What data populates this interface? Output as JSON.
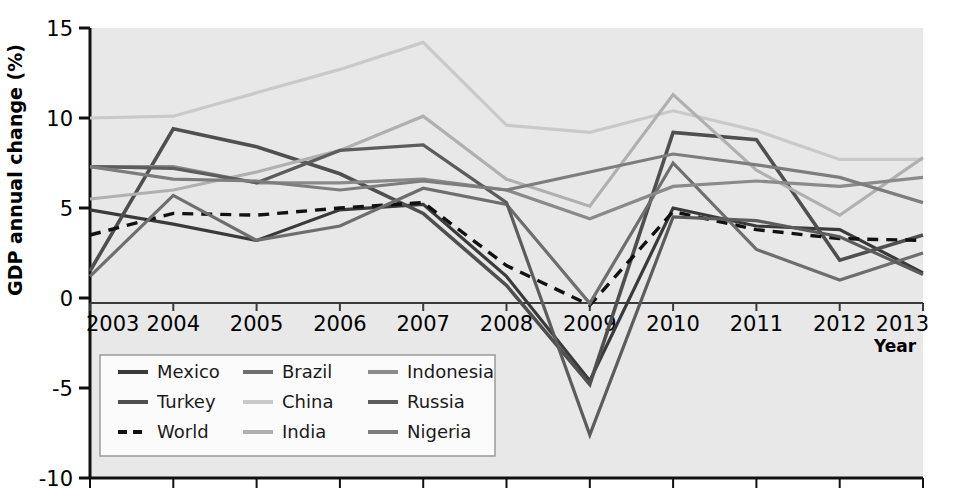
{
  "chart_data": {
    "type": "line",
    "title": "",
    "xlabel": "Year",
    "ylabel": "GDP annual change (%)",
    "x": [
      2003,
      2004,
      2005,
      2006,
      2007,
      2008,
      2009,
      2010,
      2011,
      2012,
      2013
    ],
    "xtick_labels": [
      "2003",
      "2004",
      "2005",
      "2006",
      "2007",
      "2008",
      "2009",
      "2010",
      "2011",
      "2012",
      "2013"
    ],
    "ytick_labels": [
      "15",
      "10",
      "5",
      "0",
      "-5",
      "-10"
    ],
    "ytick_values": [
      15,
      10,
      5,
      0,
      -5,
      -10
    ],
    "ylim": [
      -10,
      15
    ],
    "xlim": [
      2003,
      2013
    ],
    "grid": false,
    "plot_background": "#e8e8e8",
    "legend_position": "lower-left-inside-axes",
    "series": [
      {
        "name": "Mexico",
        "color": "#3a3a3a",
        "dash": "none",
        "width": 3.2,
        "values": [
          4.9,
          4.1,
          3.2,
          4.9,
          5.2,
          1.2,
          -4.6,
          5.0,
          4.0,
          3.8,
          1.4
        ]
      },
      {
        "name": "Turkey",
        "color": "#4f4f4f",
        "dash": "none",
        "width": 3.6,
        "values": [
          1.5,
          9.4,
          8.4,
          6.9,
          4.7,
          0.7,
          -4.8,
          9.2,
          8.8,
          2.1,
          3.5
        ]
      },
      {
        "name": "World",
        "color": "#111111",
        "dash": "dashed",
        "width": 3.4,
        "values": [
          3.5,
          4.7,
          4.6,
          5.0,
          5.3,
          1.8,
          -0.4,
          4.8,
          3.8,
          3.3,
          3.2
        ]
      },
      {
        "name": "Brazil",
        "color": "#6e6e6e",
        "dash": "none",
        "width": 3.2,
        "values": [
          1.2,
          5.7,
          3.2,
          4.0,
          6.1,
          5.2,
          -0.3,
          7.5,
          2.7,
          1.0,
          2.5
        ]
      },
      {
        "name": "China",
        "color": "#c9c9c9",
        "dash": "none",
        "width": 3.2,
        "values": [
          10.0,
          10.1,
          11.4,
          12.7,
          14.2,
          9.6,
          9.2,
          10.4,
          9.3,
          7.7,
          7.7
        ]
      },
      {
        "name": "India",
        "color": "#b0b0b0",
        "dash": "none",
        "width": 3.2,
        "values": [
          5.5,
          6.0,
          7.0,
          8.2,
          10.1,
          6.6,
          5.1,
          11.3,
          7.1,
          4.6,
          7.8
        ]
      },
      {
        "name": "Indonesia",
        "color": "#8a8a8a",
        "dash": "none",
        "width": 3.2,
        "values": [
          7.3,
          7.3,
          6.4,
          6.4,
          6.6,
          6.0,
          4.4,
          6.2,
          6.5,
          6.2,
          6.7
        ]
      },
      {
        "name": "Russia",
        "color": "#5c5c5c",
        "dash": "none",
        "width": 3.2,
        "values": [
          7.3,
          7.2,
          6.4,
          8.2,
          8.5,
          5.3,
          -7.6,
          4.5,
          4.3,
          3.4,
          1.3
        ]
      },
      {
        "name": "Nigeria",
        "color": "#7d7d7d",
        "dash": "none",
        "width": 3.2,
        "values": [
          7.3,
          6.6,
          6.5,
          6.0,
          6.5,
          6.0,
          7.0,
          8.0,
          7.4,
          6.7,
          5.3
        ]
      }
    ],
    "legend_entries": [
      {
        "label": "Mexico",
        "color": "#3a3a3a",
        "dash": "none"
      },
      {
        "label": "Brazil",
        "color": "#6e6e6e",
        "dash": "none"
      },
      {
        "label": "Indonesia",
        "color": "#8a8a8a",
        "dash": "none"
      },
      {
        "label": "Turkey",
        "color": "#4f4f4f",
        "dash": "none"
      },
      {
        "label": "China",
        "color": "#c9c9c9",
        "dash": "none"
      },
      {
        "label": "Russia",
        "color": "#5c5c5c",
        "dash": "none"
      },
      {
        "label": "World",
        "color": "#111111",
        "dash": "dashed"
      },
      {
        "label": "India",
        "color": "#b0b0b0",
        "dash": "none"
      },
      {
        "label": "Nigeria",
        "color": "#7d7d7d",
        "dash": "none"
      }
    ]
  }
}
